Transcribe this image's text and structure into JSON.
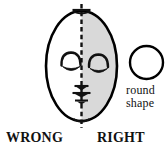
{
  "figure": {
    "caption_left": "WRONG",
    "caption_right": "RIGHT",
    "annotation": {
      "line1": "round",
      "line2": "shape"
    }
  },
  "colors": {
    "ink": "#111111",
    "outline": "#000000",
    "shade": "#d9d9d9",
    "background": "#ffffff"
  },
  "shapes": {
    "face_oval": {
      "name": "face-oval",
      "cx": 81.5,
      "cy": 66,
      "rx": 35.5,
      "ry": 55,
      "shaded_half": "right"
    },
    "symmetry_axis": {
      "name": "vertical-dashed-centerline",
      "x": 81.5,
      "y_top": 4,
      "y_bottom": 128,
      "style": "dashed"
    },
    "reference_circle": {
      "name": "round-shape-circle",
      "cx": 146.5,
      "cy": 62.5,
      "r": 16.5
    },
    "eyes": [
      {
        "name": "left-eye",
        "cx": 71,
        "cy": 62
      },
      {
        "name": "right-eye",
        "cx": 99,
        "cy": 64
      }
    ],
    "axis_marks": [
      {
        "name": "brow-tick",
        "y": 10,
        "half_width": 9
      },
      {
        "name": "nose-tick",
        "y": 86,
        "half_width": 7
      },
      {
        "name": "nose-base-tick",
        "y": 93,
        "half_width": 9
      },
      {
        "name": "mouth-tick",
        "y": 100,
        "half_width": 7
      }
    ]
  }
}
